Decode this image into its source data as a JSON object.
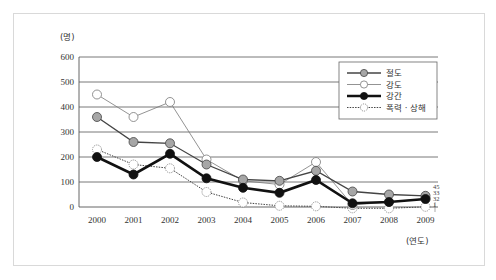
{
  "chart_data": {
    "type": "line",
    "title": "",
    "ylabel": "(명)",
    "xlabel": "(연도)",
    "ylim": [
      0,
      600
    ],
    "yticks": [
      0,
      100,
      200,
      300,
      400,
      500,
      600
    ],
    "grid": true,
    "legend_position": "top-right",
    "categories": [
      "2000",
      "2001",
      "2002",
      "2003",
      "2004",
      "2005",
      "2006",
      "2007",
      "2008",
      "2009"
    ],
    "series": [
      {
        "name": "절도",
        "style": "gray-filled",
        "values": [
          360,
          260,
          255,
          170,
          110,
          105,
          145,
          62,
          50,
          45
        ]
      },
      {
        "name": "강도",
        "style": "open",
        "values": [
          450,
          360,
          420,
          190,
          105,
          90,
          180,
          8,
          20,
          33
        ]
      },
      {
        "name": "강간",
        "style": "black-filled-thick",
        "values": [
          200,
          130,
          213,
          115,
          77,
          57,
          108,
          15,
          20,
          32
        ]
      },
      {
        "name": "폭력 · 상해",
        "style": "dotted-open",
        "values": [
          230,
          170,
          155,
          60,
          18,
          5,
          3,
          -5,
          -5,
          1
        ]
      }
    ],
    "end_labels": [
      "45",
      "33",
      "32",
      "1"
    ]
  },
  "colors": {
    "grid": "#555555",
    "gray_marker": "#a6a6a6",
    "line_dark": "#111111",
    "line_mid": "#444444",
    "line_light": "#777777"
  }
}
